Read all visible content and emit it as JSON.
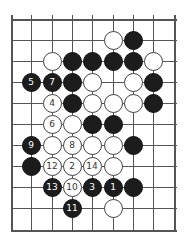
{
  "board": {
    "cols_x": [
      11,
      31,
      52,
      72,
      92,
      113,
      133,
      153,
      174
    ],
    "rows_y": [
      19,
      40,
      61,
      82,
      103,
      124,
      145,
      166,
      187,
      208,
      230
    ],
    "line_color": "#555555",
    "black_color": "#1c1c1c",
    "white_color": "#ffffff"
  },
  "stones": [
    {
      "c": 5,
      "r": 1,
      "color": "w",
      "label": ""
    },
    {
      "c": 6,
      "r": 1,
      "color": "b",
      "label": ""
    },
    {
      "c": 2,
      "r": 2,
      "color": "w",
      "label": ""
    },
    {
      "c": 3,
      "r": 2,
      "color": "b",
      "label": ""
    },
    {
      "c": 4,
      "r": 2,
      "color": "b",
      "label": ""
    },
    {
      "c": 5,
      "r": 2,
      "color": "b",
      "label": ""
    },
    {
      "c": 6,
      "r": 2,
      "color": "b",
      "label": ""
    },
    {
      "c": 7,
      "r": 2,
      "color": "w",
      "label": ""
    },
    {
      "c": 1,
      "r": 3,
      "color": "b",
      "label": "5"
    },
    {
      "c": 2,
      "r": 3,
      "color": "b",
      "label": "7"
    },
    {
      "c": 3,
      "r": 3,
      "color": "b",
      "label": ""
    },
    {
      "c": 4,
      "r": 3,
      "color": "w",
      "label": ""
    },
    {
      "c": 6,
      "r": 3,
      "color": "w",
      "label": ""
    },
    {
      "c": 7,
      "r": 3,
      "color": "b",
      "label": ""
    },
    {
      "c": 2,
      "r": 4,
      "color": "w",
      "label": "4"
    },
    {
      "c": 3,
      "r": 4,
      "color": "b",
      "label": ""
    },
    {
      "c": 4,
      "r": 4,
      "color": "w",
      "label": ""
    },
    {
      "c": 5,
      "r": 4,
      "color": "w",
      "label": ""
    },
    {
      "c": 6,
      "r": 4,
      "color": "w",
      "label": ""
    },
    {
      "c": 7,
      "r": 4,
      "color": "b",
      "label": ""
    },
    {
      "c": 2,
      "r": 5,
      "color": "w",
      "label": "6"
    },
    {
      "c": 3,
      "r": 5,
      "color": "w",
      "label": ""
    },
    {
      "c": 4,
      "r": 5,
      "color": "b",
      "label": ""
    },
    {
      "c": 5,
      "r": 5,
      "color": "b",
      "label": ""
    },
    {
      "c": 1,
      "r": 6,
      "color": "b",
      "label": "9"
    },
    {
      "c": 2,
      "r": 6,
      "color": "w",
      "label": ""
    },
    {
      "c": 3,
      "r": 6,
      "color": "w",
      "label": "8"
    },
    {
      "c": 4,
      "r": 6,
      "color": "w",
      "label": ""
    },
    {
      "c": 5,
      "r": 6,
      "color": "w",
      "label": ""
    },
    {
      "c": 6,
      "r": 6,
      "color": "b",
      "label": ""
    },
    {
      "c": 1,
      "r": 7,
      "color": "b",
      "label": ""
    },
    {
      "c": 2,
      "r": 7,
      "color": "w",
      "label": "12"
    },
    {
      "c": 3,
      "r": 7,
      "color": "w",
      "label": "2"
    },
    {
      "c": 4,
      "r": 7,
      "color": "w",
      "label": "14"
    },
    {
      "c": 5,
      "r": 7,
      "color": "w",
      "label": ""
    },
    {
      "c": 2,
      "r": 8,
      "color": "b",
      "label": "13"
    },
    {
      "c": 3,
      "r": 8,
      "color": "w",
      "label": "10"
    },
    {
      "c": 4,
      "r": 8,
      "color": "b",
      "label": "3"
    },
    {
      "c": 5,
      "r": 8,
      "color": "b",
      "label": "1"
    },
    {
      "c": 6,
      "r": 8,
      "color": "b",
      "label": ""
    },
    {
      "c": 3,
      "r": 9,
      "color": "b",
      "label": "11"
    },
    {
      "c": 5,
      "r": 9,
      "color": "w",
      "label": ""
    }
  ]
}
